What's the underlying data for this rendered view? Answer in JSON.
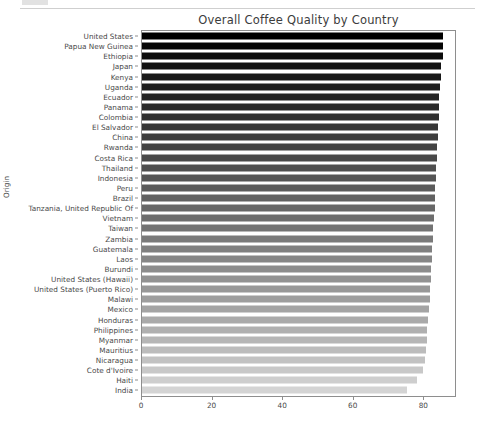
{
  "figure": {
    "title": "Overall Coffee Quality by Country",
    "ylabel": "Origin",
    "axis_color": "#8e8e8e",
    "text_color": "#4a4a4a",
    "background": "#ffffff"
  },
  "chart_data": {
    "type": "bar",
    "orientation": "horizontal",
    "title": "Overall Coffee Quality by Country",
    "xlabel": "",
    "ylabel": "Origin",
    "xlim": [
      0,
      88.7
    ],
    "xticks": [
      0,
      20,
      40,
      60,
      80
    ],
    "xtick_labels": [
      "0",
      "20",
      "40",
      "60",
      "80"
    ],
    "grid": false,
    "legend": null,
    "colormap": "grayscale sequential (dark = highest, light = lowest)",
    "categories": [
      "United States",
      "Papua New Guinea",
      "Ethiopia",
      "Japan",
      "Kenya",
      "Uganda",
      "Ecuador",
      "Panama",
      "Colombia",
      "El Salvador",
      "China",
      "Rwanda",
      "Costa Rica",
      "Thailand",
      "Indonesia",
      "Peru",
      "Brazil",
      "Tanzania, United Republic Of",
      "Vietnam",
      "Taiwan",
      "Zambia",
      "Guatemala",
      "Laos",
      "Burundi",
      "United States (Hawaii)",
      "United States (Puerto Rico)",
      "Malawi",
      "Mexico",
      "Honduras",
      "Philippines",
      "Myanmar",
      "Mauritius",
      "Nicaragua",
      "Cote d'Ivoire",
      "Haiti",
      "India"
    ],
    "values": [
      85.4,
      85.3,
      85.2,
      84.7,
      84.6,
      84.5,
      84.3,
      84.2,
      84.1,
      84.0,
      83.8,
      83.7,
      83.5,
      83.4,
      83.2,
      83.1,
      83.0,
      82.9,
      82.7,
      82.6,
      82.4,
      82.3,
      82.1,
      82.0,
      81.9,
      81.7,
      81.5,
      81.3,
      81.1,
      80.9,
      80.7,
      80.5,
      80.3,
      79.6,
      77.9,
      75.2
    ],
    "bar_colors": [
      "#000000",
      "#060606",
      "#0c0c0c",
      "#121212",
      "#181818",
      "#1e1e1e",
      "#242424",
      "#2a2a2a",
      "#303030",
      "#363636",
      "#3d3d3d",
      "#434343",
      "#494949",
      "#4f4f4f",
      "#555555",
      "#5b5b5b",
      "#616161",
      "#676767",
      "#6d6d6d",
      "#737373",
      "#7a7a7a",
      "#808080",
      "#868686",
      "#8c8c8c",
      "#929292",
      "#989898",
      "#9e9e9e",
      "#a4a4a4",
      "#aaaaaa",
      "#b0b0b0",
      "#b6b6b6",
      "#bcbcbc",
      "#c2c2c2",
      "#c8c8c8",
      "#cecece",
      "#d4d4d4"
    ]
  }
}
